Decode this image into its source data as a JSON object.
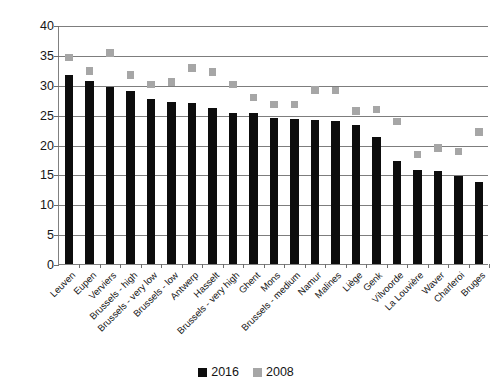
{
  "chart_data": {
    "type": "bar",
    "title": "",
    "subtitle": "",
    "xlabel": "",
    "ylabel": "Percentage points",
    "ylim": [
      0,
      40
    ],
    "ytick_step": 5,
    "yticks": [
      0,
      5,
      10,
      15,
      20,
      25,
      30,
      35,
      40
    ],
    "grid": true,
    "legend_position": "bottom",
    "categories": [
      "Leuven",
      "Eupen",
      "Verviers",
      "Brussels - high",
      "Brussels - very low",
      "Brussels - low",
      "Antwerp",
      "Hasselt",
      "Brussels - very high",
      "Ghent",
      "Mons",
      "Brussels - medium",
      "Namur",
      "Malines",
      "Liège",
      "Genk",
      "Vilvoorde",
      "La Louvière",
      "Waver",
      "Charleroi",
      "Bruges"
    ],
    "series": [
      {
        "name": "2016",
        "mark": "bar",
        "color": "#0d0d0d",
        "values": [
          31.7,
          30.6,
          29.7,
          28.9,
          27.6,
          27.1,
          26.9,
          26.1,
          25.3,
          25.3,
          24.4,
          24.3,
          24.1,
          24.0,
          23.3,
          21.3,
          17.2,
          15.8,
          15.6,
          14.8,
          13.8
        ]
      },
      {
        "name": "2008",
        "mark": "square-marker",
        "color": "#a6a6a6",
        "values": [
          34.7,
          32.5,
          35.5,
          31.8,
          30.2,
          30.6,
          33.0,
          32.3,
          30.2,
          28.0,
          26.9,
          26.9,
          29.3,
          29.2,
          25.8,
          26.0,
          24.0,
          18.5,
          19.6,
          19.0,
          22.3
        ]
      }
    ]
  },
  "legend": {
    "items": [
      {
        "label": "2016",
        "color": "#0d0d0d"
      },
      {
        "label": "2008",
        "color": "#a6a6a6"
      }
    ]
  }
}
